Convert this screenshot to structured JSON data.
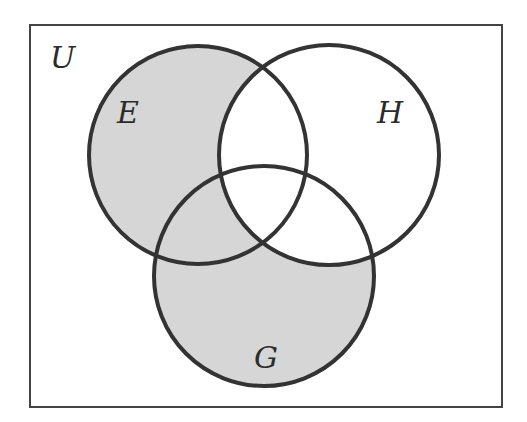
{
  "diagram": {
    "type": "venn",
    "universe_label": "U",
    "sets": [
      {
        "id": "E",
        "label": "E",
        "cx": 198,
        "cy": 155,
        "r": 109
      },
      {
        "id": "H",
        "label": "H",
        "cx": 329,
        "cy": 155,
        "r": 110
      },
      {
        "id": "G",
        "label": "G",
        "cx": 264,
        "cy": 276,
        "r": 110
      }
    ],
    "shaded_region": "(E ∪ G) \\ H",
    "colors": {
      "shade": "#d6d6d6",
      "stroke": "#333333",
      "border": "#444444",
      "background": "#ffffff"
    }
  }
}
